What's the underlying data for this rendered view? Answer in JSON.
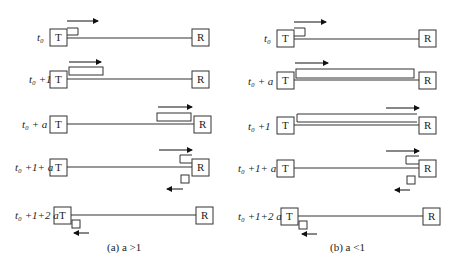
{
  "panels": [
    {
      "caption": "(a)  a >1",
      "rows": [
        {
          "label": "t₀",
          "sender": "T",
          "receiver": "R"
        },
        {
          "label": "t₀ +1",
          "sender": "T",
          "receiver": "R"
        },
        {
          "label": "t₀ + a",
          "sender": "T",
          "receiver": "R"
        },
        {
          "label": "t₀ +1+ a",
          "sender": "T",
          "receiver": "R"
        },
        {
          "label": "t₀ +1+2 a",
          "sender": "T",
          "receiver": "R"
        }
      ]
    },
    {
      "caption": "(b)  a <1",
      "rows": [
        {
          "label": "t₀",
          "sender": "T",
          "receiver": "R"
        },
        {
          "label": "t₀ + a",
          "sender": "T",
          "receiver": "R"
        },
        {
          "label": "t₀ +1",
          "sender": "T",
          "receiver": "R"
        },
        {
          "label": "t₀ +1+ a",
          "sender": "T",
          "receiver": "R"
        },
        {
          "label": "t₀ +1+2 a",
          "sender": "T",
          "receiver": "R"
        }
      ]
    }
  ]
}
